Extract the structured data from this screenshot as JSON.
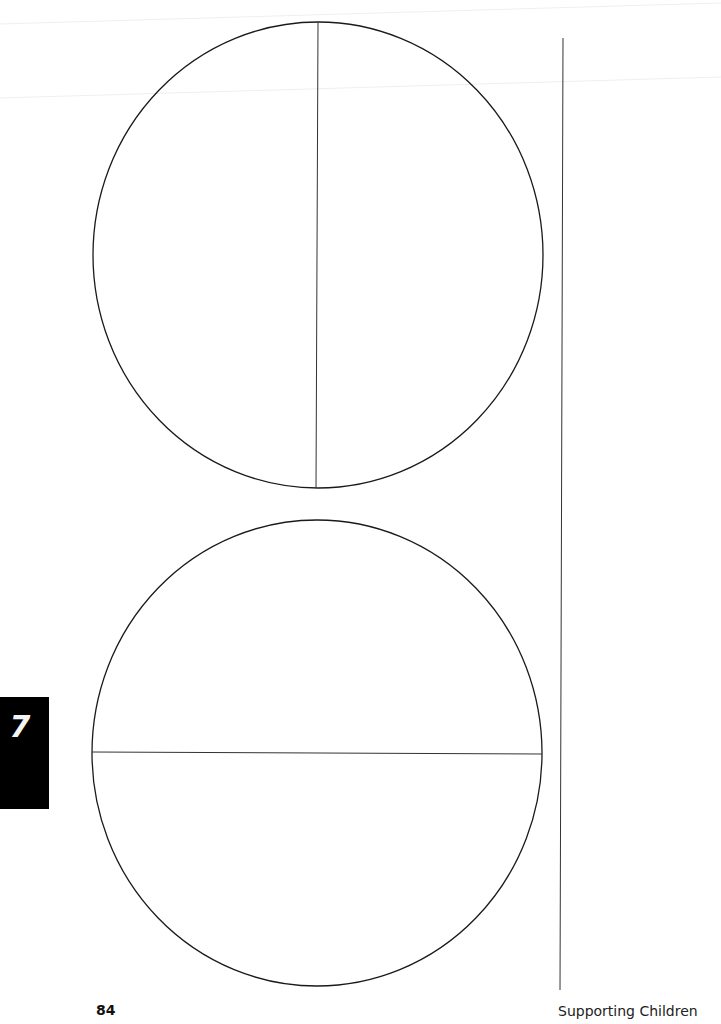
{
  "page": {
    "chapter_number": "7",
    "page_number": "84",
    "footer_title": "Supporting Children"
  },
  "figures": {
    "top_circle": {
      "cx": 318,
      "cy": 255,
      "r": 225,
      "divider": "vertical",
      "halves": 2
    },
    "bottom_circle": {
      "cx": 317,
      "cy": 753,
      "r": 225,
      "divider": "horizontal",
      "halves": 2
    },
    "margin_rule": {
      "x": 560,
      "y1": 38,
      "y2": 990
    }
  },
  "colors": {
    "ink": "#1a1a1a",
    "tab_background": "#000000",
    "tab_text": "#f4f4f4",
    "fold_line": "#ececec"
  }
}
